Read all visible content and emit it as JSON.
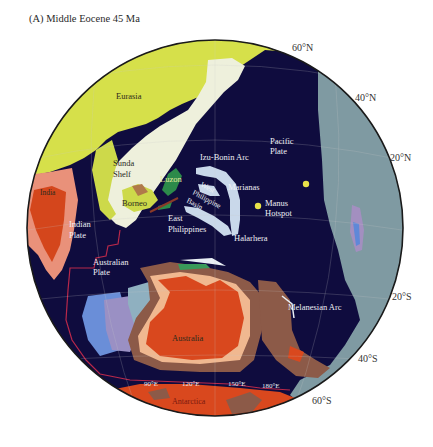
{
  "figure": {
    "title": "(A)  Middle Eocene 45 Ma",
    "panel": "A",
    "epoch": "Middle Eocene",
    "age": "45 Ma"
  },
  "colors": {
    "ocean": "#0f0c3e",
    "eurasia": "#d6e04a",
    "shelf": "#eef0dc",
    "pacific_plate_east": "#7f9aa2",
    "australia": "#d9481e",
    "australia_margin": "#f0b890",
    "brown_terrane": "#8c5a48",
    "india": "#d4461c",
    "india_margin": "#e9917a",
    "arc": "#c9d8ea",
    "hotspot": "#e8e24a",
    "plate_boundary": "#b8284a",
    "blue_terrane": "#6a8ed8",
    "lilac_terrane": "#9a90c4",
    "globe_outline": "#1a1a1a"
  },
  "labels": {
    "eurasia": "Eurasia",
    "sunda_shelf_1": "Sunda",
    "sunda_shelf_2": "Shelf",
    "india": "India",
    "indian_plate_1": "Indian",
    "indian_plate_2": "Plate",
    "borneo": "Borneo",
    "luzon": "Luzon",
    "west_philippine_basin_1": "West",
    "west_philippine_basin_2": "Philippine",
    "west_philippine_basin_3": "Basin",
    "east_philippines_1": "East",
    "east_philippines_2": "Philippines",
    "izu_bonin_arc": "Izu-Bonin Arc",
    "marianas": "Marianas",
    "halarhera": "Halarhera",
    "pacific_plate_1": "Pacific",
    "pacific_plate_2": "Plate",
    "manus_hotspot_1": "Manus",
    "manus_hotspot_2": "Hotspot",
    "australian_plate_1": "Australian",
    "australian_plate_2": "Plate",
    "australia": "Australia",
    "melanesian_arc": "Melanesian Arc",
    "antarctica": "Antarctica"
  },
  "latitude_labels": [
    "60°N",
    "40°N",
    "20°N",
    "20°S",
    "40°S",
    "60°S"
  ],
  "longitude_labels": [
    "90°E",
    "120°E",
    "150°E",
    "180°E"
  ]
}
